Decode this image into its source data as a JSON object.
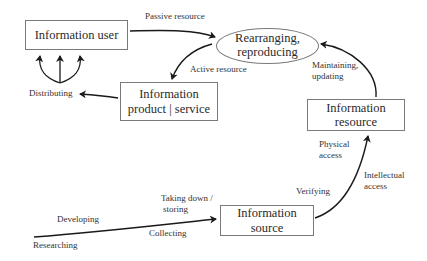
{
  "nodes": {
    "information_user": "Information user",
    "rearranging_line1": "Rearranging,",
    "rearranging_line2": "reproducing",
    "product_line1": "Information",
    "product_line2": "product | service",
    "resource_line1": "Information",
    "resource_line2": "resource",
    "source_line1": "Information",
    "source_line2": "source"
  },
  "edge_labels": {
    "passive_resource": "Passive resource",
    "active_resource": "Active resource",
    "distributing": "Distributing",
    "maintaining_line1": "Maintaining,",
    "maintaining_line2": "updating",
    "physical_line1": "Physical",
    "physical_line2": "access",
    "intellectual_line1": "Intellectual",
    "intellectual_line2": "access",
    "verifying": "Verifying",
    "taking_down_line1": "Taking down /",
    "taking_down_line2": "storing",
    "developing": "Developing",
    "collecting": "Collecting",
    "researching": "Researching"
  }
}
